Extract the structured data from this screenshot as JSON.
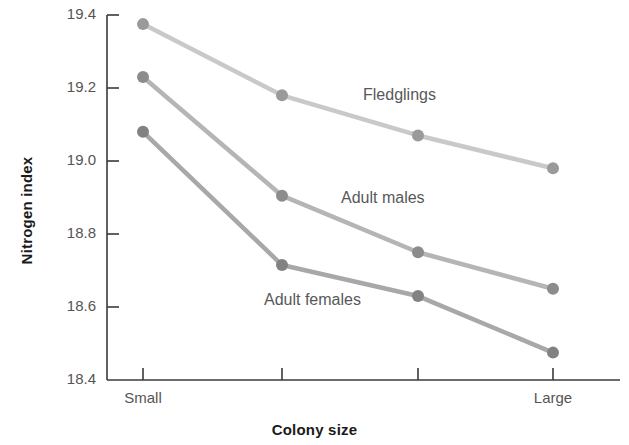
{
  "chart_data": {
    "type": "line",
    "title": "",
    "xlabel": "Colony size",
    "ylabel": "Nitrogen index",
    "categories": [
      "Small",
      "",
      "",
      "Large"
    ],
    "xticklabels": [
      "Small",
      "Large"
    ],
    "yticklabels": [
      "19.4",
      "19.2",
      "19.0",
      "18.8",
      "18.6",
      "18.4"
    ],
    "ylim": [
      18.4,
      19.4
    ],
    "ytick_values": [
      19.4,
      19.2,
      19.0,
      18.8,
      18.6,
      18.4
    ],
    "grid": false,
    "legend_position": "inline-annotations",
    "series": [
      {
        "name": "Fledglings",
        "color": "#c9c9c9",
        "marker_color": "#9a9a9a",
        "values": [
          19.375,
          19.18,
          19.07,
          18.98
        ]
      },
      {
        "name": "Adult males",
        "color": "#b5b5b5",
        "marker_color": "#8c8c8c",
        "values": [
          19.23,
          18.905,
          18.75,
          18.65
        ]
      },
      {
        "name": "Adult females",
        "color": "#a8a8a8",
        "marker_color": "#828282",
        "values": [
          19.08,
          18.715,
          18.63,
          18.475
        ]
      }
    ],
    "annotations": [
      {
        "text": "Fledglings",
        "x": 363,
        "y": 86
      },
      {
        "text": "Adult males",
        "x": 341,
        "y": 189
      },
      {
        "text": "Adult females",
        "x": 264,
        "y": 291
      }
    ],
    "axis_color": "#3a3a3a"
  }
}
